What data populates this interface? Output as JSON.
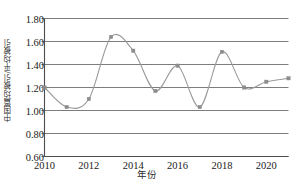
{
  "chart_data": {
    "type": "line",
    "title": "",
    "xlabel": "年份",
    "ylabel": "中国篇均被引/平均被引",
    "x": [
      2010,
      2011,
      2012,
      2013,
      2014,
      2015,
      2016,
      2017,
      2018,
      2019,
      2020,
      2021
    ],
    "values": [
      1.2,
      1.03,
      1.1,
      1.64,
      1.52,
      1.17,
      1.39,
      1.03,
      1.51,
      1.2,
      1.25,
      1.28
    ],
    "series": [
      {
        "name": "中国篇均被引/平均被引",
        "values": [
          1.2,
          1.03,
          1.1,
          1.64,
          1.52,
          1.17,
          1.39,
          1.03,
          1.51,
          1.2,
          1.25,
          1.28
        ]
      }
    ],
    "xlim": [
      2010,
      2021
    ],
    "ylim": [
      0.6,
      1.8
    ],
    "yticks": [
      "0.60",
      "0.80",
      "1.00",
      "1.20",
      "1.40",
      "1.60",
      "1.80"
    ],
    "ytick_values": [
      0.6,
      0.8,
      1.0,
      1.2,
      1.4,
      1.6,
      1.8
    ],
    "xticks": [
      "2010",
      "2012",
      "2014",
      "2016",
      "2018",
      "2020"
    ],
    "xtick_values": [
      2010,
      2012,
      2014,
      2016,
      2018,
      2020
    ],
    "grid": "horizontal",
    "legend": "none",
    "marker": "square",
    "smoothing": "spline",
    "colors": {
      "line": "#9a9a9a",
      "marker": "#8c8c8c",
      "grid": "#7d7d7d",
      "axis": "#4d4d4d",
      "text": "#1a1a1a",
      "background": "#ffffff"
    }
  }
}
